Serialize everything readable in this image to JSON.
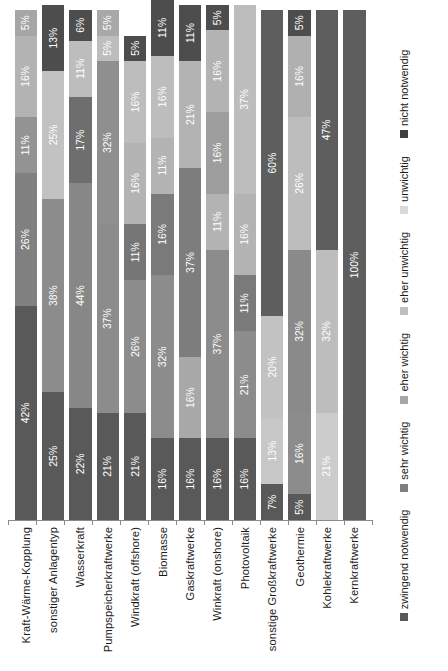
{
  "chart_data": {
    "type": "bar",
    "title": "",
    "subtitle": "",
    "xlabel": "",
    "ylabel": "",
    "orientation": "horizontal-stacked-100",
    "grid": false,
    "legend_position": "bottom",
    "xlim": [
      0,
      100
    ],
    "value_suffix": "%",
    "categories": [
      "Kraft-Wärme-Kopplung",
      "sonstiger Anlagentyp",
      "Wasserkraft",
      "Pumpspeicherkraftwerke",
      "Windkraft (offshore)",
      "Biomasse",
      "Gaskraftwerke",
      "Winkraft (onshore)",
      "Photovoltaik",
      "sonstige Großkraftwerke",
      "Geothermie",
      "Kohlekraftwerke",
      "Kernkraftwerke"
    ],
    "series": [
      {
        "name": "zwingend notwendig",
        "color": "#595959",
        "values": [
          42,
          25,
          22,
          21,
          21,
          16,
          16,
          16,
          16,
          7,
          5,
          null,
          null
        ]
      },
      {
        "name": "sehr wichtig",
        "color": "#808080",
        "values": [
          26,
          38,
          44,
          37,
          21,
          32,
          16,
          37,
          21,
          null,
          16,
          null,
          null
        ]
      },
      {
        "name": "eher wichtig",
        "color": "#a6a6a6",
        "values": [
          11,
          25,
          17,
          32,
          26,
          16,
          37,
          11,
          11,
          13,
          32,
          21,
          null
        ]
      },
      {
        "name": "eher unwichtig",
        "color": "#bfbfbf",
        "values": [
          16,
          null,
          11,
          5,
          11,
          11,
          21,
          16,
          16,
          20,
          26,
          32,
          null
        ]
      },
      {
        "name": "unwichtig",
        "color": "#d9d9d9",
        "values": [
          5,
          null,
          null,
          5,
          16,
          16,
          null,
          16,
          37,
          null,
          16,
          null,
          null
        ]
      },
      {
        "name": "nicht notwendig",
        "color": "#404040",
        "values": [
          null,
          13,
          6,
          5,
          5,
          11,
          11,
          5,
          null,
          60,
          5,
          47,
          100
        ]
      }
    ],
    "stacks": [
      {
        "category": "Kraft-Wärme-Kopplung",
        "segments": [
          {
            "series": "zwingend notwendig",
            "value": 42,
            "label": "42%",
            "color": "#595959"
          },
          {
            "series": "sehr wichtig",
            "value": 26,
            "label": "26%",
            "color": "#808080"
          },
          {
            "series": "eher wichtig",
            "value": 11,
            "label": "11%",
            "color": "#939393"
          },
          {
            "series": "eher unwichtig",
            "value": 16,
            "label": "16%",
            "color": "#b3b3b3"
          },
          {
            "series": "unwichtig",
            "value": 5,
            "label": "5%",
            "color": "#a6a6a6"
          }
        ]
      },
      {
        "category": "sonstiger Anlagentyp",
        "segments": [
          {
            "series": "zwingend notwendig",
            "value": 25,
            "label": "25%",
            "color": "#595959"
          },
          {
            "series": "sehr wichtig",
            "value": 38,
            "label": "38%",
            "color": "#8c8c8c"
          },
          {
            "series": "eher wichtig",
            "value": 25,
            "label": "25%",
            "color": "#c2c2c2"
          },
          {
            "series": "nicht notwendig",
            "value": 13,
            "label": "13%",
            "color": "#4d4d4d"
          }
        ]
      },
      {
        "category": "Wasserkraft",
        "segments": [
          {
            "series": "zwingend notwendig",
            "value": 22,
            "label": "22%",
            "color": "#595959"
          },
          {
            "series": "sehr wichtig",
            "value": 44,
            "label": "44%",
            "color": "#878787"
          },
          {
            "series": "eher wichtig",
            "value": 17,
            "label": "17%",
            "color": "#6e6e6e"
          },
          {
            "series": "eher unwichtig",
            "value": 11,
            "label": "11%",
            "color": "#bdbdbd"
          },
          {
            "series": "nicht notwendig",
            "value": 6,
            "label": "6%",
            "color": "#4d4d4d"
          }
        ]
      },
      {
        "category": "Pumpspeicherkraftwerke",
        "segments": [
          {
            "series": "zwingend notwendig",
            "value": 21,
            "label": "21%",
            "color": "#595959"
          },
          {
            "series": "sehr wichtig",
            "value": 37,
            "label": "37%",
            "color": "#8c8c8c"
          },
          {
            "series": "eher wichtig",
            "value": 32,
            "label": "32%",
            "color": "#8f8f8f"
          },
          {
            "series": "eher unwichtig",
            "value": 5,
            "label": "5%",
            "color": "#bdbdbd"
          },
          {
            "series": "nicht notwendig",
            "value": 5,
            "label": "5%",
            "color": "#a8a8a8"
          }
        ]
      },
      {
        "category": "Windkraft (offshore)",
        "segments": [
          {
            "series": "zwingend notwendig",
            "value": 21,
            "label": "21%",
            "color": "#595959"
          },
          {
            "series": "sehr wichtig",
            "value": 26,
            "label": "26%",
            "color": "#8c8c8c"
          },
          {
            "series": "eher wichtig",
            "value": 11,
            "label": "11%",
            "color": "#767676"
          },
          {
            "series": "eher unwichtig",
            "value": 16,
            "label": "16%",
            "color": "#b3b3b3"
          },
          {
            "series": "unwichtig",
            "value": 16,
            "label": "16%",
            "color": "#bdbdbd"
          },
          {
            "series": "nicht notwendig",
            "value": 5,
            "label": "5%",
            "color": "#4d4d4d"
          }
        ]
      },
      {
        "category": "Biomasse",
        "segments": [
          {
            "series": "zwingend notwendig",
            "value": 16,
            "label": "16%",
            "color": "#595959"
          },
          {
            "series": "sehr wichtig",
            "value": 32,
            "label": "32%",
            "color": "#8c8c8c"
          },
          {
            "series": "eher wichtig",
            "value": 16,
            "label": "16%",
            "color": "#7a7a7a"
          },
          {
            "series": "eher unwichtig",
            "value": 11,
            "label": "11%",
            "color": "#b3b3b3"
          },
          {
            "series": "unwichtig",
            "value": 16,
            "label": "16%",
            "color": "#bdbdbd"
          },
          {
            "series": "nicht notwendig",
            "value": 11,
            "label": "11%",
            "color": "#4d4d4d"
          }
        ]
      },
      {
        "category": "Gaskraftwerke",
        "segments": [
          {
            "series": "zwingend notwendig",
            "value": 16,
            "label": "16%",
            "color": "#595959"
          },
          {
            "series": "sehr wichtig",
            "value": 16,
            "label": "16%",
            "color": "#a8a8a8"
          },
          {
            "series": "eher wichtig",
            "value": 37,
            "label": "37%",
            "color": "#7d7d7d"
          },
          {
            "series": "eher unwichtig",
            "value": 21,
            "label": "21%",
            "color": "#b3b3b3"
          },
          {
            "series": "nicht notwendig",
            "value": 11,
            "label": "11%",
            "color": "#4d4d4d"
          }
        ]
      },
      {
        "category": "Winkraft (onshore)",
        "segments": [
          {
            "series": "zwingend notwendig",
            "value": 16,
            "label": "16%",
            "color": "#595959"
          },
          {
            "series": "sehr wichtig",
            "value": 37,
            "label": "37%",
            "color": "#8c8c8c"
          },
          {
            "series": "eher wichtig",
            "value": 11,
            "label": "11%",
            "color": "#b3b3b3"
          },
          {
            "series": "eher unwichtig",
            "value": 16,
            "label": "16%",
            "color": "#9e9e9e"
          },
          {
            "series": "unwichtig",
            "value": 16,
            "label": "16%",
            "color": "#b3b3b3"
          },
          {
            "series": "nicht notwendig",
            "value": 5,
            "label": "5%",
            "color": "#4d4d4d"
          }
        ]
      },
      {
        "category": "Photovoltaik",
        "segments": [
          {
            "series": "zwingend notwendig",
            "value": 16,
            "label": "16%",
            "color": "#595959"
          },
          {
            "series": "sehr wichtig",
            "value": 21,
            "label": "21%",
            "color": "#8c8c8c"
          },
          {
            "series": "eher wichtig",
            "value": 11,
            "label": "11%",
            "color": "#7a7a7a"
          },
          {
            "series": "eher unwichtig",
            "value": 16,
            "label": "16%",
            "color": "#b3b3b3"
          },
          {
            "series": "unwichtig",
            "value": 37,
            "label": "37%",
            "color": "#bdbdbd"
          }
        ]
      },
      {
        "category": "sonstige Großkraftwerke",
        "segments": [
          {
            "series": "zwingend notwendig",
            "value": 7,
            "label": "7%",
            "color": "#595959"
          },
          {
            "series": "eher wichtig",
            "value": 13,
            "label": "13%",
            "color": "#c7c7c7"
          },
          {
            "series": "eher unwichtig",
            "value": 20,
            "label": "20%",
            "color": "#c2c2c2"
          },
          {
            "series": "nicht notwendig",
            "value": 60,
            "label": "60%",
            "color": "#5e5e5e"
          }
        ]
      },
      {
        "category": "Geothermie",
        "segments": [
          {
            "series": "zwingend notwendig",
            "value": 5,
            "label": "5%",
            "color": "#595959"
          },
          {
            "series": "sehr wichtig",
            "value": 16,
            "label": "16%",
            "color": "#8c8c8c"
          },
          {
            "series": "eher wichtig",
            "value": 32,
            "label": "32%",
            "color": "#8a8a8a"
          },
          {
            "series": "eher unwichtig",
            "value": 26,
            "label": "26%",
            "color": "#bdbdbd"
          },
          {
            "series": "unwichtig",
            "value": 16,
            "label": "16%",
            "color": "#b0b0b0"
          },
          {
            "series": "nicht notwendig",
            "value": 5,
            "label": "5%",
            "color": "#4d4d4d"
          }
        ]
      },
      {
        "category": "Kohlekraftwerke",
        "segments": [
          {
            "series": "eher wichtig",
            "value": 21,
            "label": "21%",
            "color": "#cccccc"
          },
          {
            "series": "eher unwichtig",
            "value": 32,
            "label": "32%",
            "color": "#bdbdbd"
          },
          {
            "series": "nicht notwendig",
            "value": 47,
            "label": "47%",
            "color": "#5e5e5e"
          }
        ]
      },
      {
        "category": "Kernkraftwerke",
        "segments": [
          {
            "series": "nicht notwendig",
            "value": 100,
            "label": "100%",
            "color": "#5e5e5e"
          }
        ]
      }
    ],
    "legend": [
      {
        "label": "zwingend notwendig",
        "color": "#595959"
      },
      {
        "label": "sehr wichtig",
        "color": "#808080"
      },
      {
        "label": "eher wichtig",
        "color": "#a6a6a6"
      },
      {
        "label": "eher unwichtig",
        "color": "#bfbfbf"
      },
      {
        "label": "unwichtig",
        "color": "#d9d9d9"
      },
      {
        "label": "nicht notwendig",
        "color": "#404040"
      }
    ]
  }
}
